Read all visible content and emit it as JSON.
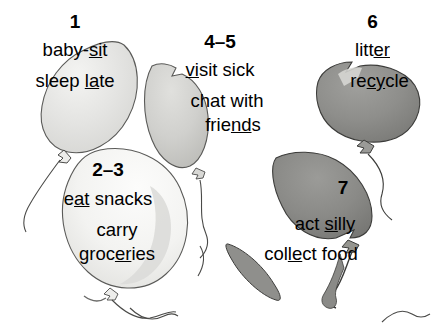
{
  "page": {
    "kind": "balloons-vocabulary-worksheet",
    "width": 435,
    "height": 333,
    "background_color": "#ffffff",
    "text_color": "#000000"
  },
  "groups": [
    {
      "id": "group-1",
      "number": "1",
      "lines": [
        {
          "pre": "baby-",
          "mark": "si",
          "post": "t"
        },
        {
          "pre": "sleep ",
          "mark": "la",
          "post": "te"
        }
      ]
    },
    {
      "id": "group-2-3",
      "number": "2–3",
      "lines": [
        {
          "pre": "e",
          "mark": "at",
          "post": " snacks"
        },
        {
          "pre": "carry",
          "mark": "",
          "post": ""
        },
        {
          "pre": "groc",
          "mark": "er",
          "post": "ies"
        }
      ]
    },
    {
      "id": "group-4-5",
      "number": "4–5",
      "lines": [
        {
          "pre": "",
          "mark": "vi",
          "post": "sit sick"
        },
        {
          "pre": "chat with",
          "mark": "",
          "post": ""
        },
        {
          "pre": "frie",
          "mark": "nd",
          "post": "s"
        }
      ]
    },
    {
      "id": "group-6",
      "number": "6",
      "lines": [
        {
          "pre": "litt",
          "mark": "er",
          "post": ""
        },
        {
          "pre": "re",
          "mark": "cy",
          "post": "cle"
        }
      ]
    },
    {
      "id": "group-7",
      "number": "7",
      "lines": [
        {
          "pre": "act ",
          "mark": "si",
          "post": "lly"
        },
        {
          "pre": "col",
          "mark": "le",
          "post": "ct food"
        }
      ]
    }
  ],
  "balloons": [
    {
      "id": "balloon-1",
      "label": "balloon-light-gray-upper-left",
      "fill": "#e3e3e1",
      "outline": "#4a4a4a"
    },
    {
      "id": "balloon-2-3",
      "label": "balloon-white-lower-left",
      "fill": "#f2f2f0",
      "outline": "#4a4a4a"
    },
    {
      "id": "balloon-4-5",
      "label": "balloon-mid-gray-center",
      "fill": "#d2d2d0",
      "outline": "#4a4a4a"
    },
    {
      "id": "balloon-6",
      "label": "balloon-dark-gray-upper-right",
      "fill": "#8d8d8a",
      "outline": "#3a3a3a"
    },
    {
      "id": "balloon-7",
      "label": "balloon-dark-gray-lower-right",
      "fill": "#8a8a87",
      "outline": "#3a3a3a"
    },
    {
      "id": "balloon-8",
      "label": "balloon-sliver-bottom-center",
      "fill": "#8a8a87",
      "outline": "#3a3a3a"
    }
  ]
}
